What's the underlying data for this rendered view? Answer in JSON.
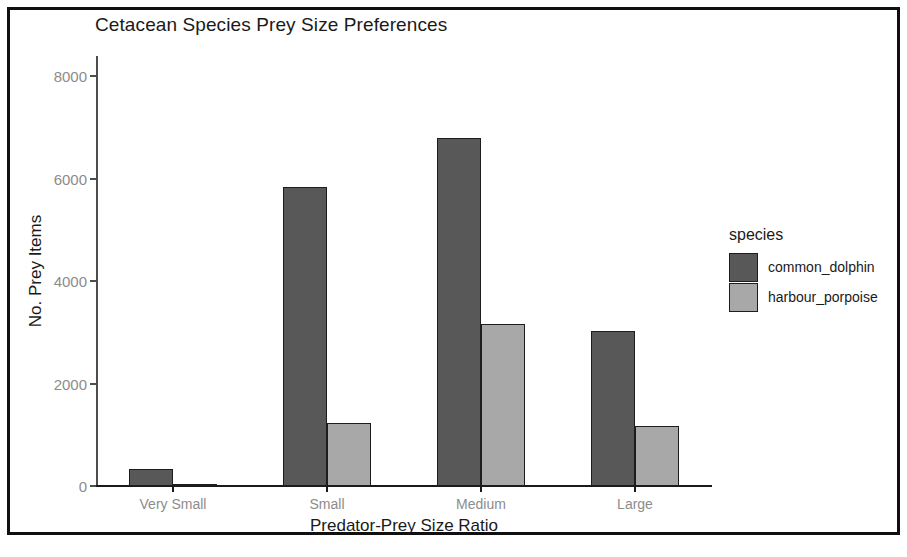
{
  "chart_data": {
    "type": "bar",
    "title": "Cetacean Species Prey Size Preferences",
    "xlabel": "Predator-Prey Size Ratio",
    "ylabel": "No. Prey Items",
    "categories": [
      "Very Small",
      "Small",
      "Medium",
      "Large"
    ],
    "series": [
      {
        "name": "common_dolphin",
        "color": "#585858",
        "values": [
          330,
          5840,
          6800,
          3030
        ]
      },
      {
        "name": "harbour_porpoise",
        "color": "#a8a8a8",
        "values": [
          20,
          1230,
          3170,
          1170
        ]
      }
    ],
    "ylim": [
      0,
      8400
    ],
    "yticks": [
      0,
      2000,
      4000,
      6000,
      8000
    ],
    "ytick_labels": [
      "0",
      "2000",
      "4000",
      "6000",
      "8000"
    ],
    "grid": false,
    "legend": {
      "title": "species",
      "position": "right"
    },
    "bar_mode": "grouped",
    "bar_outline_color": "#1d1d1d",
    "axis_color": "#1a1a1a",
    "tick_label_color": "#8c8c8c",
    "background_color": "#ffffff",
    "frame_color": "#101010"
  }
}
